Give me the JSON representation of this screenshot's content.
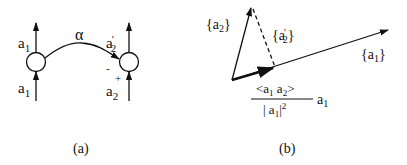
{
  "panel_a": {
    "caption": "(a)",
    "left_node": {
      "top_label": "a",
      "top_sub": "1",
      "bottom_label": "a",
      "bottom_sub": "1"
    },
    "right_node": {
      "top_label": "a",
      "top_prime": "'",
      "top_sub": "2",
      "bottom_label": "a",
      "bottom_sub": "2",
      "minus_sign": "-",
      "plus_sign": "+"
    },
    "connection_label": "α"
  },
  "panel_b": {
    "caption": "(b)",
    "vector_a2": {
      "open": "{",
      "label": "a",
      "sub": "2",
      "close": "}"
    },
    "vector_a2_prime": {
      "open": "{",
      "label": "a",
      "prime": "'",
      "sub": "2",
      "close": "}"
    },
    "vector_a1": {
      "open": "{",
      "label": "a",
      "sub": "1",
      "close": "}"
    },
    "projection": {
      "numerator": "<a",
      "num_sub1": "1",
      "num_mid": " a",
      "num_sub2": "2",
      "num_close": ">",
      "denominator_open": "| a",
      "den_sub": "1",
      "den_close": "|",
      "den_sup": "2",
      "factor": "a",
      "factor_sub": "1"
    }
  },
  "colors": {
    "stroke": "#111111",
    "background": "#ffffff"
  }
}
